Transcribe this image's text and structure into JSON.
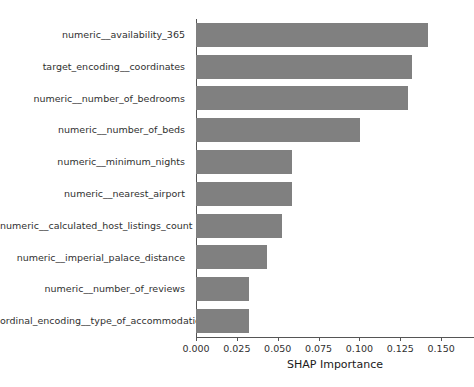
{
  "chart_data": {
    "type": "bar",
    "orientation": "horizontal",
    "title": "",
    "xlabel": "SHAP Importance",
    "ylabel": "",
    "xlim": [
      0.0,
      0.1597
    ],
    "grid": false,
    "legend": null,
    "bar_color": "#808080",
    "xticks": [
      0.0,
      0.025,
      0.05,
      0.075,
      0.1,
      0.125,
      0.15
    ],
    "xtick_labels": [
      "0.000",
      "0.025",
      "0.050",
      "0.075",
      "0.100",
      "0.125",
      "0.150"
    ],
    "categories": [
      "numeric__availability_365",
      "target_encoding__coordinates",
      "numeric__number_of_bedrooms",
      "numeric__number_of_beds",
      "numeric__minimum_nights",
      "numeric__nearest_airport",
      "numeric__calculated_host_listings_count",
      "numeric__imperial_palace_distance",
      "numeric__number_of_reviews",
      "ordinal_encoding__type_of_accommodation"
    ],
    "values": [
      0.142,
      0.1322,
      0.1299,
      0.1006,
      0.0586,
      0.0586,
      0.0529,
      0.0437,
      0.0322,
      0.0322
    ]
  }
}
